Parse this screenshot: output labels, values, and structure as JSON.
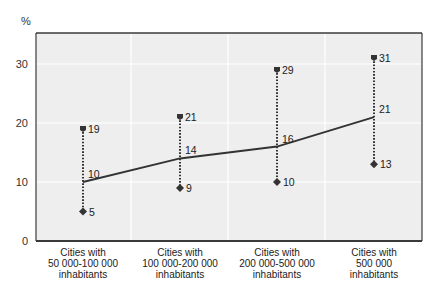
{
  "chart_data": {
    "type": "line",
    "title": "",
    "xlabel": "",
    "ylabel": "%",
    "ylim": [
      0,
      35
    ],
    "yticks": [
      0,
      10,
      20,
      30
    ],
    "grid": true,
    "legend": "none",
    "categories": [
      [
        "Cities with",
        "50 000-100 000",
        "inhabitants"
      ],
      [
        "Cities with",
        "100 000-200 000",
        "inhabitants"
      ],
      [
        "Cities with",
        "200 000-500 000",
        "inhabitants"
      ],
      [
        "Cities with",
        "500 000",
        "inhabitants"
      ]
    ],
    "series": [
      {
        "name": "average",
        "style": "solid-line",
        "values": [
          10,
          14,
          16,
          21
        ]
      },
      {
        "name": "maximum",
        "style": "square-marker",
        "values": [
          19,
          21,
          29,
          31
        ]
      },
      {
        "name": "minimum",
        "style": "diamond-marker",
        "values": [
          5,
          9,
          10,
          13
        ]
      }
    ],
    "range_style": "dotted vertical line from minimum to maximum"
  },
  "colors": {
    "plot_bg": "#eeeeee",
    "frame": "#3a3a3a",
    "line": "#333333",
    "grid": "#ffffff"
  }
}
